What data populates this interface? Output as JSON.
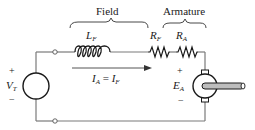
{
  "diagram": {
    "sections": {
      "field": "Field",
      "armature": "Armature"
    },
    "components": {
      "field_inductor": {
        "symbol": "L",
        "subscript": "F"
      },
      "field_resistor": {
        "symbol": "R",
        "subscript": "F"
      },
      "armature_resistor": {
        "symbol": "R",
        "subscript": "A"
      },
      "source": {
        "symbol": "V",
        "subscript": "T",
        "plus": "+",
        "minus": "−"
      },
      "motor": {
        "symbol": "E",
        "subscript": "A",
        "plus": "+",
        "minus": "−"
      }
    },
    "current": {
      "lhs": "I",
      "lhs_sub": "A",
      "eq": " = ",
      "rhs": "I",
      "rhs_sub": "F"
    },
    "colors": {
      "wire": "#7a7a7a",
      "symbol": "#1a1a1a",
      "shaft_fill": "#bdbdbd"
    }
  }
}
